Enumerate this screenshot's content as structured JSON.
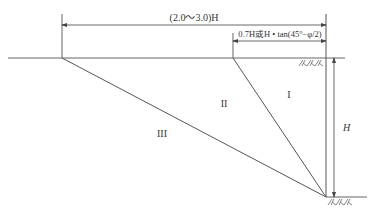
{
  "diagram": {
    "type": "slope-zoning",
    "dimensions": {
      "total_width": "(2.0～3.0)H",
      "inner_width": "0.7H或H • tan(45°−φ/2)",
      "height": "H"
    },
    "zones": [
      {
        "id": "I",
        "label": "I"
      },
      {
        "id": "II",
        "label": "II"
      },
      {
        "id": "III",
        "label": "III"
      }
    ],
    "hatch_symbol": "//\\//\\//\\",
    "colors": {
      "line": "#555555",
      "text": "#333333",
      "background": "#ffffff"
    }
  }
}
